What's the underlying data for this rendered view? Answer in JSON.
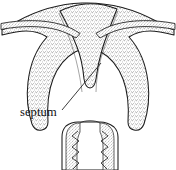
{
  "figure": {
    "background_color": "#ffffff",
    "ink_color": "#1a1a1a",
    "stipple_color": "#6e6e6e",
    "width": 176,
    "height": 170
  },
  "annotations": [
    {
      "id": "septum-label",
      "text": "septum",
      "x": 20,
      "y": 116,
      "leader_line": {
        "from_x": 62,
        "from_y": 110,
        "to_x": 101,
        "to_y": 63
      }
    }
  ],
  "structures": [
    {
      "id": "fundus",
      "name": "uterine fundus"
    },
    {
      "id": "septum",
      "name": "septum"
    },
    {
      "id": "left-horn",
      "name": "left uterine horn"
    },
    {
      "id": "right-horn",
      "name": "right uterine horn"
    },
    {
      "id": "left-tube",
      "name": "left fallopian tube"
    },
    {
      "id": "right-tube",
      "name": "right fallopian tube"
    },
    {
      "id": "myometrium",
      "name": "myometrium wall (stippled)"
    },
    {
      "id": "cervical-canal",
      "name": "cervical canal with rugae"
    },
    {
      "id": "cervix",
      "name": "cervix"
    }
  ]
}
